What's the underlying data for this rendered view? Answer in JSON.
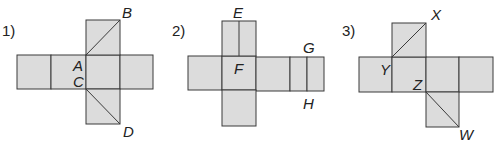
{
  "figures": [
    {
      "number": "1)",
      "description": "Cube net (cross shape) with diagonal segments drawn on two faces",
      "labels": {
        "A": "A",
        "B": "B",
        "C": "C",
        "D": "D"
      },
      "segments": [
        "AB",
        "CD"
      ]
    },
    {
      "number": "2)",
      "description": "Cuboid net with segment EF on top face and segment GH on a narrow side face",
      "labels": {
        "E": "E",
        "F": "F",
        "G": "G",
        "H": "H"
      },
      "segments": [
        "EF",
        "GH"
      ]
    },
    {
      "number": "3)",
      "description": "Cube net with diagonal segments drawn on two faces",
      "labels": {
        "X": "X",
        "Y": "Y",
        "Z": "Z",
        "W": "W"
      },
      "segments": [
        "XY",
        "ZW"
      ]
    }
  ]
}
